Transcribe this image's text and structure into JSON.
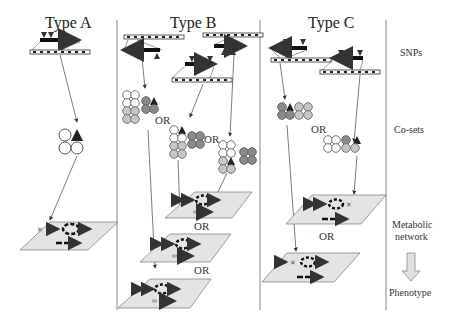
{
  "columns": [
    {
      "title": "Type A"
    },
    {
      "title": "Type B"
    },
    {
      "title": "Type C"
    }
  ],
  "row_labels": {
    "snps": "SNPs",
    "cosets": "Co-sets",
    "network_line1": "Metabolic",
    "network_line2": "network",
    "phenotype": "Phenotype"
  },
  "connector": "OR",
  "colors": {
    "line": "#555555",
    "plane": "#e4e4e4",
    "circle_light": "#c6c6c6",
    "circle_dark": "#8a8a8a",
    "circle_white": "#ffffff",
    "arrow_dark": "#111111",
    "arrow_light": "#bdbdbd",
    "big_arrow": "#e0e0e0"
  }
}
